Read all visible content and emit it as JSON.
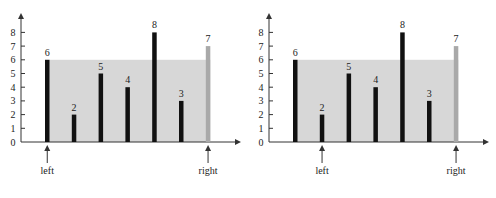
{
  "colors": {
    "bar": "#111111",
    "highlight_bar": "#a9a9a9",
    "water": "#d7d7d7",
    "axis": "#333333",
    "text": "#222222"
  },
  "chart_data": [
    {
      "type": "bar",
      "title": "",
      "categories": [
        "0",
        "1",
        "2",
        "3",
        "4",
        "5",
        "6"
      ],
      "values": [
        6,
        2,
        5,
        4,
        8,
        3,
        7
      ],
      "highlighted_index": 6,
      "shaded_area": {
        "from_index": 0,
        "to_index": 6,
        "height": 6
      },
      "pointers": [
        {
          "label": "left",
          "index": 0
        },
        {
          "label": "right",
          "index": 6
        }
      ],
      "y_ticks": [
        0,
        1,
        2,
        3,
        4,
        5,
        6,
        7,
        8
      ],
      "ylim": [
        0,
        9
      ],
      "grid": false,
      "xlabel": "",
      "ylabel": ""
    },
    {
      "type": "bar",
      "title": "",
      "categories": [
        "0",
        "1",
        "2",
        "3",
        "4",
        "5",
        "6"
      ],
      "values": [
        6,
        2,
        5,
        4,
        8,
        3,
        7
      ],
      "highlighted_index": 6,
      "shaded_area": {
        "from_index": 0,
        "to_index": 6,
        "height": 6
      },
      "pointers": [
        {
          "label": "left",
          "index": 1
        },
        {
          "label": "right",
          "index": 6
        }
      ],
      "y_ticks": [
        0,
        1,
        2,
        3,
        4,
        5,
        6,
        7,
        8
      ],
      "ylim": [
        0,
        9
      ],
      "grid": false,
      "xlabel": "",
      "ylabel": ""
    }
  ]
}
